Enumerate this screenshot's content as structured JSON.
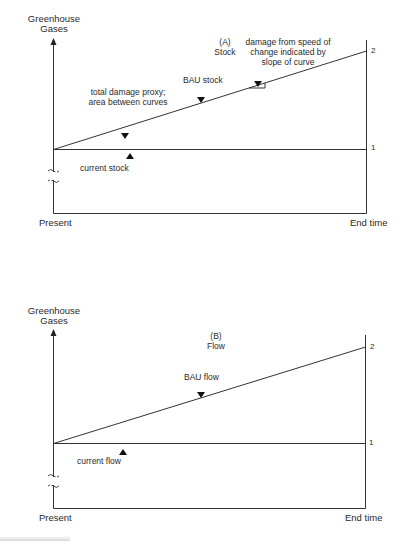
{
  "panels": [
    {
      "id": "A",
      "title_line1": "(A)",
      "title_line2": "Stock",
      "y_axis_label_line1": "Greenhouse",
      "y_axis_label_line2": "Gases",
      "x_start_label": "Present",
      "x_end_label": "End time",
      "level_high": "2",
      "level_low": "1",
      "bau_label": "BAU stock",
      "current_label": "current stock",
      "area_note_line1": "total damage proxy;",
      "area_note_line2": "area between curves",
      "slope_note_line1": "damage from speed of",
      "slope_note_line2": "change indicated by",
      "slope_note_line3": "slope of curve"
    },
    {
      "id": "B",
      "title_line1": "(B)",
      "title_line2": "Flow",
      "y_axis_label_line1": "Greenhouse",
      "y_axis_label_line2": "Gases",
      "x_start_label": "Present",
      "x_end_label": "End time",
      "level_high": "2",
      "level_low": "1",
      "bau_label": "BAU flow",
      "current_label": "current flow"
    }
  ],
  "colors": {
    "line": "#333333",
    "text": "#2a2a2a",
    "background": "#ffffff"
  }
}
